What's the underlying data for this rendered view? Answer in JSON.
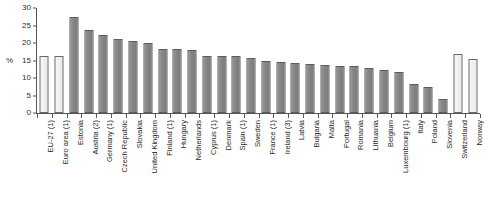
{
  "chart_data": {
    "type": "bar",
    "title": "",
    "subtitle": "",
    "xlabel": "",
    "ylabel": "%",
    "ylim": [
      0,
      30
    ],
    "yticks": [
      0,
      5,
      10,
      15,
      20,
      25,
      30
    ],
    "grid": false,
    "legend": "none",
    "categories": [
      "EU-27 (1)",
      "Euro area (1)",
      "Estonia",
      "Austria (2)",
      "Germany (1)",
      "Czech Republic",
      "Slovakia",
      "United Kingdom",
      "Finland (1)",
      "Hungary",
      "Netherlands",
      "Cyprus (1)",
      "Denmark",
      "Spain (1)",
      "Sweden",
      "France (1)",
      "Ireland (3)",
      "Latvia",
      "Bulgaria",
      "Malta",
      "Portugal",
      "Romania",
      "Lithuania",
      "Belgium",
      "Luxembourg (1)",
      "Italy",
      "Poland",
      "Slovenia",
      "Switzerland",
      "Norway"
    ],
    "values": [
      16.2,
      16.2,
      27.4,
      23.8,
      22.4,
      21.1,
      20.5,
      20.1,
      18.3,
      18.2,
      17.9,
      16.3,
      16.2,
      16.2,
      15.7,
      14.8,
      14.5,
      14.2,
      14.1,
      13.7,
      13.5,
      13.3,
      13.0,
      12.3,
      11.6,
      8.4,
      7.4,
      4.0,
      16.8,
      15.4
    ],
    "series_styles": [
      "light",
      "light",
      "dark",
      "dark",
      "dark",
      "dark",
      "dark",
      "dark",
      "dark",
      "dark",
      "dark",
      "dark",
      "dark",
      "dark",
      "dark",
      "dark",
      "dark",
      "dark",
      "dark",
      "dark",
      "dark",
      "dark",
      "dark",
      "dark",
      "dark",
      "dark",
      "dark",
      "dark",
      "light",
      "light"
    ],
    "colors": {
      "bar_dark": "#868686",
      "bar_light": "#f0f0f0",
      "bar_border": "#5c5c5c",
      "axis": "#555555",
      "text": "#2b2b2b",
      "background": "#ffffff"
    }
  }
}
